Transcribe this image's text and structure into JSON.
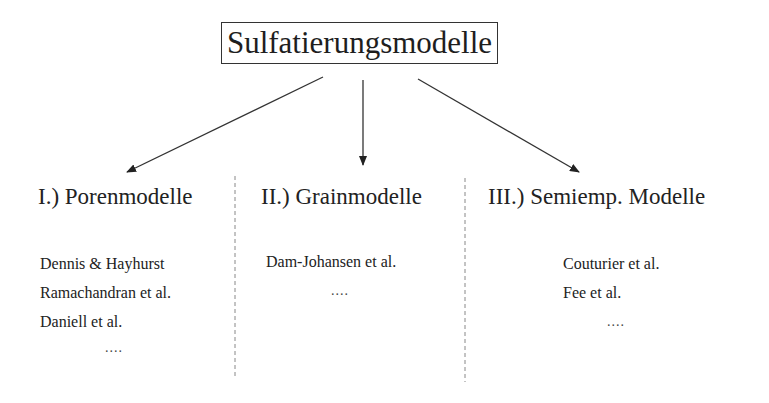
{
  "root": {
    "title": "Sulfatierungsmodelle"
  },
  "categories": [
    {
      "title": "I.) Porenmodelle",
      "items": [
        "Dennis & Hayhurst",
        "Ramachandran et al.",
        "Daniell et al."
      ],
      "ellipsis": "...."
    },
    {
      "title": "II.) Grainmodelle",
      "items": [
        "Dam-Johansen et al."
      ],
      "ellipsis": "...."
    },
    {
      "title": "III.) Semiemp. Modelle",
      "items": [
        "Couturier et al.",
        "Fee et al."
      ],
      "ellipsis": "...."
    }
  ],
  "colors": {
    "line": "#333333",
    "dashed_separator": "#888888",
    "text": "#222222"
  }
}
